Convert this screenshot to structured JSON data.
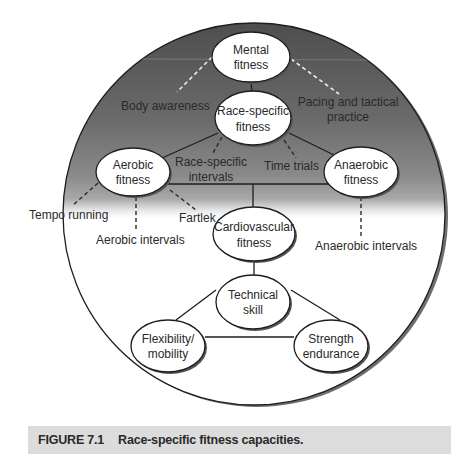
{
  "figure": {
    "nodes": {
      "mental": {
        "line1": "Mental",
        "line2": "fitness"
      },
      "race_specific": {
        "line1": "Race-specific",
        "line2": "fitness"
      },
      "aerobic": {
        "line1": "Aerobic",
        "line2": "fitness"
      },
      "anaerobic": {
        "line1": "Anaerobic",
        "line2": "fitness"
      },
      "cardiovascular": {
        "line1": "Cardiovascular",
        "line2": "fitness"
      },
      "technical": {
        "line1": "Technical",
        "line2": "skill"
      },
      "flexibility": {
        "line1": "Flexibility/",
        "line2": "mobility"
      },
      "strength": {
        "line1": "Strength",
        "line2": "endurance"
      }
    },
    "labels": {
      "body_awareness": "Body awareness",
      "pacing_line1": "Pacing and tactical",
      "pacing_line2": "practice",
      "race_intervals_line1": "Race-specific",
      "race_intervals_line2": "intervals",
      "time_trials": "Time trials",
      "tempo_running": "Tempo running",
      "aerobic_intervals": "Aerobic intervals",
      "fartlek": "Fartlek",
      "anaerobic_intervals": "Anaerobic intervals"
    },
    "colors": {
      "gradient_top": "#555555",
      "gradient_mid": "#8c8c8c",
      "background": "#ffffff",
      "stroke": "#1e1e1e",
      "caption_bg": "#dcdcdc"
    }
  },
  "caption": {
    "label": "FIGURE 7.1",
    "text": "Race-specific fitness capacities."
  }
}
